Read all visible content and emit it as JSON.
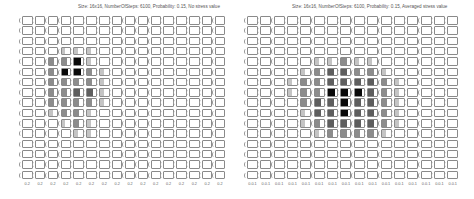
{
  "chart_data": [
    {
      "type": "heatmap",
      "title": "Size: 16x16, NumberOfSteps: 6100, Probability: 0.15, No stress value",
      "rows": 16,
      "cols": 16,
      "levels_legend": {
        "0": "empty",
        "1": "light",
        "2": "medium",
        "3": "dark",
        "4": "black"
      },
      "x_tick_labels": [
        "0.2",
        "0.2",
        "0.2",
        "0.2",
        "0.2",
        "0.2",
        "0.2",
        "0.2",
        "0.2",
        "0.2",
        "0.2",
        "0.2",
        "0.2",
        "0.2",
        "0.2",
        "0.2"
      ],
      "values": [
        [
          0,
          0,
          0,
          0,
          0,
          0,
          0,
          0,
          0,
          0,
          0,
          0,
          0,
          0,
          0,
          0
        ],
        [
          0,
          0,
          0,
          0,
          0,
          0,
          0,
          0,
          0,
          0,
          0,
          0,
          0,
          0,
          0,
          0
        ],
        [
          0,
          0,
          0,
          0,
          0,
          0,
          0,
          0,
          0,
          0,
          0,
          0,
          0,
          0,
          0,
          0
        ],
        [
          0,
          0,
          0,
          1,
          1,
          1,
          0,
          0,
          0,
          0,
          0,
          0,
          0,
          0,
          0,
          0
        ],
        [
          0,
          0,
          2,
          2,
          4,
          1,
          0,
          0,
          0,
          0,
          0,
          0,
          0,
          0,
          0,
          0
        ],
        [
          0,
          0,
          2,
          4,
          4,
          2,
          1,
          0,
          0,
          0,
          0,
          0,
          0,
          0,
          0,
          0
        ],
        [
          0,
          0,
          2,
          2,
          2,
          2,
          1,
          0,
          0,
          0,
          0,
          0,
          0,
          0,
          0,
          0
        ],
        [
          0,
          0,
          2,
          2,
          3,
          3,
          1,
          0,
          0,
          0,
          0,
          0,
          0,
          0,
          0,
          0
        ],
        [
          0,
          0,
          2,
          2,
          2,
          2,
          1,
          0,
          0,
          0,
          0,
          0,
          0,
          0,
          0,
          0
        ],
        [
          0,
          0,
          1,
          2,
          2,
          1,
          0,
          0,
          0,
          0,
          0,
          0,
          0,
          0,
          0,
          0
        ],
        [
          0,
          0,
          0,
          1,
          2,
          1,
          0,
          0,
          0,
          0,
          0,
          0,
          0,
          0,
          0,
          0
        ],
        [
          0,
          0,
          0,
          0,
          1,
          1,
          0,
          0,
          0,
          0,
          0,
          0,
          0,
          0,
          0,
          0
        ],
        [
          0,
          0,
          0,
          0,
          0,
          0,
          0,
          0,
          0,
          0,
          0,
          0,
          0,
          0,
          0,
          0
        ],
        [
          0,
          0,
          0,
          0,
          0,
          0,
          0,
          0,
          0,
          0,
          0,
          0,
          0,
          0,
          0,
          0
        ],
        [
          0,
          0,
          0,
          0,
          0,
          0,
          0,
          0,
          0,
          0,
          0,
          0,
          0,
          0,
          0,
          0
        ],
        [
          0,
          0,
          0,
          0,
          0,
          0,
          0,
          0,
          0,
          0,
          0,
          0,
          0,
          0,
          0,
          0
        ]
      ]
    },
    {
      "type": "heatmap",
      "title": "Size: 16x16, NumberOfSteps: 6100, Probability: 0.15, Averaged stress value",
      "rows": 16,
      "cols": 16,
      "levels_legend": {
        "0": "empty",
        "1": "light",
        "2": "medium",
        "3": "dark",
        "4": "black"
      },
      "x_tick_labels": [
        "0.0.1",
        "0.0.1",
        "0.0.1",
        "0.0.1",
        "0.0.1",
        "0.0.1",
        "0.0.1",
        "0.0.1",
        "0.0.1",
        "0.0.1",
        "0.0.1",
        "0.0.1",
        "0.0.1",
        "0.0.1",
        "0.0.1",
        "0.0.1"
      ],
      "values": [
        [
          0,
          0,
          0,
          0,
          0,
          0,
          0,
          0,
          0,
          0,
          0,
          0,
          0,
          0,
          0,
          0
        ],
        [
          0,
          0,
          0,
          0,
          0,
          0,
          0,
          0,
          0,
          0,
          0,
          0,
          0,
          0,
          0,
          0
        ],
        [
          0,
          0,
          0,
          0,
          0,
          0,
          0,
          0,
          0,
          0,
          0,
          0,
          0,
          0,
          0,
          0
        ],
        [
          0,
          0,
          0,
          0,
          0,
          0,
          0,
          0,
          0,
          0,
          0,
          0,
          0,
          0,
          0,
          0
        ],
        [
          0,
          0,
          0,
          0,
          0,
          1,
          1,
          2,
          1,
          1,
          0,
          0,
          0,
          0,
          0,
          0
        ],
        [
          0,
          0,
          0,
          0,
          1,
          2,
          3,
          3,
          2,
          2,
          1,
          0,
          0,
          0,
          0,
          0
        ],
        [
          0,
          0,
          0,
          1,
          2,
          2,
          3,
          3,
          3,
          3,
          2,
          1,
          0,
          0,
          0,
          0
        ],
        [
          0,
          0,
          0,
          1,
          2,
          2,
          4,
          4,
          4,
          3,
          2,
          1,
          0,
          0,
          0,
          0
        ],
        [
          0,
          0,
          0,
          0,
          2,
          3,
          3,
          4,
          3,
          3,
          2,
          1,
          0,
          0,
          0,
          0
        ],
        [
          0,
          0,
          0,
          0,
          1,
          3,
          3,
          4,
          3,
          3,
          2,
          1,
          0,
          0,
          0,
          0
        ],
        [
          0,
          0,
          0,
          0,
          1,
          2,
          3,
          3,
          3,
          3,
          2,
          1,
          0,
          0,
          0,
          0
        ],
        [
          0,
          0,
          0,
          0,
          0,
          1,
          2,
          2,
          2,
          2,
          1,
          0,
          0,
          0,
          0,
          0
        ],
        [
          0,
          0,
          0,
          0,
          0,
          0,
          0,
          0,
          0,
          0,
          0,
          0,
          0,
          0,
          0,
          0
        ],
        [
          0,
          0,
          0,
          0,
          0,
          0,
          0,
          0,
          0,
          0,
          0,
          0,
          0,
          0,
          0,
          0
        ],
        [
          0,
          0,
          0,
          0,
          0,
          0,
          0,
          0,
          0,
          0,
          0,
          0,
          0,
          0,
          0,
          0
        ],
        [
          0,
          0,
          0,
          0,
          0,
          0,
          0,
          0,
          0,
          0,
          0,
          0,
          0,
          0,
          0,
          0
        ]
      ]
    }
  ],
  "panels": [
    {
      "title": "Size: 16x16, NumberOfSteps: 6100, Probability: 0.15, No stress value"
    },
    {
      "title": "Size: 16x16, NumberOfSteps: 6100, Probability: 0.15, Averaged stress value"
    }
  ],
  "colors": {
    "level_1": "#c4c4c4",
    "level_2": "#8c8c8c",
    "level_3": "#5e5e5e",
    "level_4": "#0a0a0a",
    "border": "#8a8a8a"
  }
}
